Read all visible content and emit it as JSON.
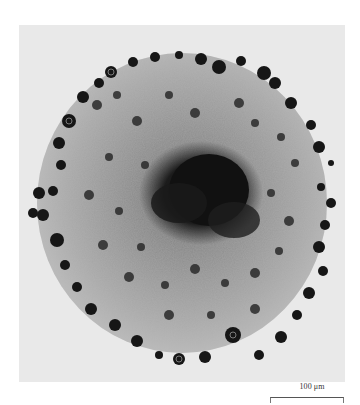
{
  "figure": {
    "background_color": "#e9e9e9",
    "cell_body_color": "#a8a8a8",
    "dark_cell_color": "#1a1a1a",
    "core_color": "#121212"
  },
  "scale_bar": {
    "label": "100 μm",
    "length_px": 74
  }
}
